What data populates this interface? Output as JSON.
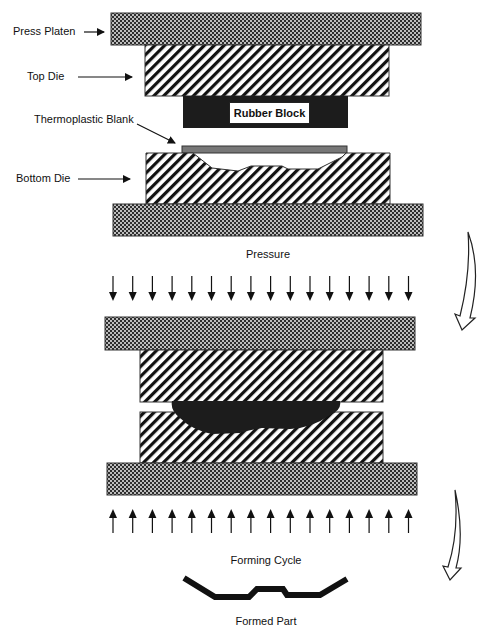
{
  "labels": {
    "press_platen": "Press Platen",
    "top_die": "Top Die",
    "thermoplastic_blank": "Thermoplastic Blank",
    "bottom_die": "Bottom Die",
    "rubber_block": "Rubber Block",
    "pressure": "Pressure",
    "forming_cycle": "Forming Cycle",
    "formed_part": "Formed Part"
  },
  "arrows": {
    "pressure_down_count": 16,
    "pressure_up_count": 16
  },
  "colors": {
    "rubber": "#1c1c1c",
    "blank": "#777777",
    "outline": "#333333",
    "text": "#111111"
  },
  "caption": "      "
}
